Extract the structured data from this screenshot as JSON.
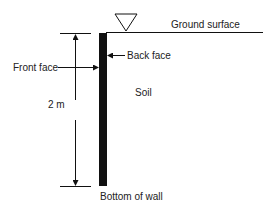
{
  "diagram": {
    "labels": {
      "ground_surface": "Ground surface",
      "back_face": "Back face",
      "front_face": "Front face",
      "height": "2 m",
      "soil": "Soil",
      "bottom_of_wall": "Bottom of wall"
    },
    "symbols": {
      "water_table_marker": "inverted-triangle"
    },
    "colors": {
      "line": "#111111",
      "wall": "#111111",
      "background": "#ffffff"
    }
  }
}
